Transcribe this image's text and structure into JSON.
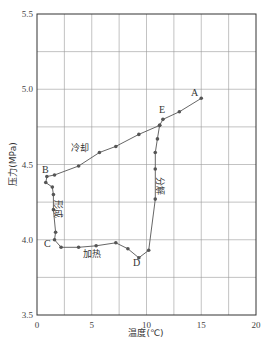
{
  "chart_data": {
    "type": "line",
    "title": "",
    "xlabel": "温度(℃)",
    "ylabel": "压力(MPa)",
    "xlim": [
      0,
      20
    ],
    "ylim": [
      3.5,
      5.5
    ],
    "x_ticks": [
      "0",
      "5",
      "10",
      "15",
      "20"
    ],
    "y_ticks": [
      "3.5",
      "4.0",
      "4.5",
      "5.0",
      "5.5"
    ],
    "grid": true,
    "grid_x_step": 2.5,
    "grid_y_step": 0.25,
    "legend": null,
    "series": [
      {
        "name": "cycle",
        "points": [
          {
            "x": 15.0,
            "y": 4.94,
            "label": "A"
          },
          {
            "x": 13.0,
            "y": 4.85
          },
          {
            "x": 11.5,
            "y": 4.8,
            "label": "E"
          },
          {
            "x": 11.2,
            "y": 4.76
          },
          {
            "x": 11.0,
            "y": 4.67
          },
          {
            "x": 10.8,
            "y": 4.58
          },
          {
            "x": 10.8,
            "y": 4.47
          },
          {
            "x": 10.8,
            "y": 4.27
          },
          {
            "x": 10.2,
            "y": 3.93
          },
          {
            "x": 9.3,
            "y": 3.88,
            "label": "D"
          },
          {
            "x": 8.3,
            "y": 3.94
          },
          {
            "x": 7.2,
            "y": 3.98
          },
          {
            "x": 5.4,
            "y": 3.96
          },
          {
            "x": 3.8,
            "y": 3.95
          },
          {
            "x": 2.2,
            "y": 3.95
          },
          {
            "x": 1.6,
            "y": 4.0,
            "label": "C"
          },
          {
            "x": 1.7,
            "y": 4.05
          },
          {
            "x": 1.5,
            "y": 4.2
          },
          {
            "x": 1.5,
            "y": 4.3
          },
          {
            "x": 1.4,
            "y": 4.35
          },
          {
            "x": 0.8,
            "y": 4.38
          },
          {
            "x": 0.9,
            "y": 4.42,
            "label": "B"
          },
          {
            "x": 1.6,
            "y": 4.43
          },
          {
            "x": 3.8,
            "y": 4.49
          },
          {
            "x": 5.7,
            "y": 4.58
          },
          {
            "x": 7.2,
            "y": 4.62
          },
          {
            "x": 9.3,
            "y": 4.7
          },
          {
            "x": 11.2,
            "y": 4.76
          }
        ]
      }
    ],
    "annotations": [
      {
        "text": "冷却",
        "x": 4.0,
        "y": 4.6
      },
      {
        "text": "形成",
        "x": 2.4,
        "y": 4.23,
        "vertical": true
      },
      {
        "text": "加热",
        "x": 6.0,
        "y": 3.88
      },
      {
        "text": "分解",
        "x": 11.8,
        "y": 4.32,
        "vertical": true
      }
    ]
  },
  "axes": {
    "xlabel": "温度(℃)",
    "ylabel": "压力(MPa)",
    "x_ticks": [
      "0",
      "5",
      "10",
      "15",
      "20"
    ],
    "y_ticks": [
      "3.5",
      "4.0",
      "4.5",
      "5.0",
      "5.5"
    ]
  },
  "annotations": {
    "cool": "冷却",
    "form": "形成",
    "heat": "加热",
    "decompose": "分解"
  },
  "points": {
    "A": "A",
    "B": "B",
    "C": "C",
    "D": "D",
    "E": "E"
  },
  "colors": {
    "line": "#555555",
    "marker": "#555555",
    "grid": "#9a9a9a",
    "frame": "#333333"
  }
}
